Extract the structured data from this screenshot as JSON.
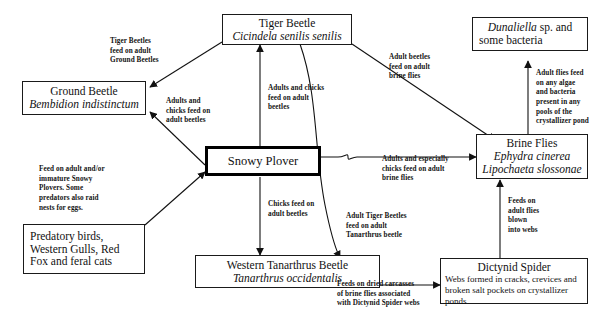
{
  "diagram": {
    "nodes": [
      {
        "id": "tiger-beetle",
        "common_name": "Tiger Beetle",
        "scientific_name": "Cicindela senilis senilis"
      },
      {
        "id": "ground-beetle",
        "common_name": "Ground Beetle",
        "scientific_name": "Bembidion indistinctum"
      },
      {
        "id": "dunaliella",
        "genus": "Dunaliella",
        "rest": " sp. and",
        "line2": "some bacteria"
      },
      {
        "id": "snowy-plover",
        "common_name": "Snowy Plover"
      },
      {
        "id": "brine-flies",
        "common_name": "Brine Flies",
        "scientific_name_1": "Ephydra cinerea",
        "scientific_name_2": "Lipochaeta slossonae"
      },
      {
        "id": "predators",
        "line1": "Predatory birds,",
        "line2": "Western Gulls, Red",
        "line3": "Fox and feral cats"
      },
      {
        "id": "tanarthrus-beetle",
        "common_name": "Western Tanarthrus Beetle",
        "scientific_name": "Tanarthrus occidentalis"
      },
      {
        "id": "dictynid-spider",
        "common_name": "Dictynid Spider",
        "description": "Webs formed in cracks, crevices and broken salt pockets on crystallizer ponds"
      }
    ],
    "edge_labels": {
      "tiger_eats_ground": "Tiger Beetles\nfeed on adult\nGround Beetles",
      "plover_eats_ground": "Adults and\nchicks feed on\nadult beetles",
      "plover_eats_tiger": "Adults and chicks\nfeed on adult\nbeetles",
      "tiger_eats_brineflies": "Adult  beetles\nfeed on adult\nbrine flies",
      "flies_eat_algae": "Adult flies feed\non any algae\nand bacteria\npresent in any\npools of the\ncrystallizer pond",
      "plover_eats_brineflies": "Adults and especially\nchicks feed on adult\nbrine flies",
      "predators_eat_plover": "Feed on adult and/or\nimmature Snowy\nPlovers.  Some\npredators also raid\nnests for eggs.",
      "plover_eats_tanarthrus": "Chicks feed on\nadult beetles",
      "tiger_eats_tanarthrus": "Adult Tiger Beetles\nfeed on adult\nTanarthrus beetle",
      "spider_eats_flies": "Feeds on\nadult flies\nblown\ninto webs",
      "tanarthrus_eats_carcasses": "Feeds on dried carcasses\nof brine flies associated\nwith Dictynid Spider webs"
    },
    "colors": {
      "ink": "#111111",
      "background": "#ffffff"
    }
  }
}
